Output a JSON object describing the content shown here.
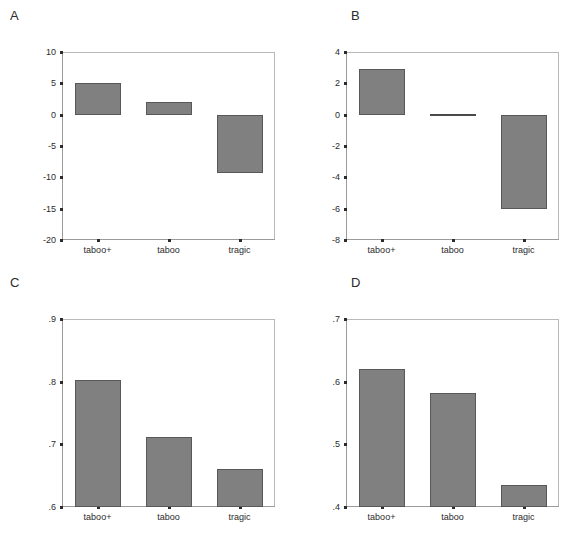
{
  "figure": {
    "background_color": "#ffffff",
    "bar_fill_color": "#808080",
    "bar_edge_color": "#585858",
    "axis_color": "#9b9b9b",
    "text_color": "#2b2b2b"
  },
  "chart_data": [
    {
      "type": "bar",
      "panel_label": "A",
      "title": "",
      "xlabel": "",
      "ylabel": "",
      "categories": [
        "taboo+",
        "taboo",
        "tragic"
      ],
      "values": [
        5.0,
        2.0,
        -9.3
      ],
      "ylim": [
        -20,
        10
      ],
      "yticks": [
        10,
        5,
        0,
        -5,
        -10,
        -15,
        -20
      ],
      "ytick_labels": [
        "10",
        "5",
        "0",
        "-5",
        "-10",
        "-15",
        "-20"
      ],
      "grid": false,
      "legend": "none",
      "baseline": 0
    },
    {
      "type": "bar",
      "panel_label": "B",
      "title": "",
      "xlabel": "",
      "ylabel": "",
      "categories": [
        "taboo+",
        "taboo",
        "tragic"
      ],
      "values": [
        2.9,
        0.0,
        -6.05
      ],
      "ylim": [
        -8,
        4
      ],
      "yticks": [
        4,
        2,
        0,
        -2,
        -4,
        -6,
        -8
      ],
      "ytick_labels": [
        "4",
        "2",
        "0",
        "-2",
        "-4",
        "-6",
        "-8"
      ],
      "grid": false,
      "legend": "none",
      "baseline": 0
    },
    {
      "type": "bar",
      "panel_label": "C",
      "title": "",
      "xlabel": "",
      "ylabel": "",
      "categories": [
        "taboo+",
        "taboo",
        "tragic"
      ],
      "values": [
        0.803,
        0.712,
        0.66
      ],
      "ylim": [
        0.6,
        0.9
      ],
      "yticks": [
        0.9,
        0.8,
        0.7,
        0.6
      ],
      "ytick_labels": [
        ".9",
        ".8",
        ".7",
        ".6"
      ],
      "grid": false,
      "legend": "none",
      "baseline": 0.6
    },
    {
      "type": "bar",
      "panel_label": "D",
      "title": "",
      "xlabel": "",
      "ylabel": "",
      "categories": [
        "taboo+",
        "taboo",
        "tragic"
      ],
      "values": [
        0.62,
        0.582,
        0.435
      ],
      "ylim": [
        0.4,
        0.7
      ],
      "yticks": [
        0.7,
        0.6,
        0.5,
        0.4
      ],
      "ytick_labels": [
        ".7",
        ".6",
        ".5",
        ".4"
      ],
      "grid": false,
      "legend": "none",
      "baseline": 0.4
    }
  ]
}
